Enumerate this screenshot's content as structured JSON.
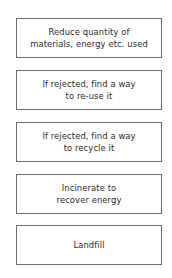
{
  "diagram": {
    "type": "waste-hierarchy",
    "steps": [
      {
        "lines": [
          "Reduce quantity of",
          "materials, energy etc. used"
        ]
      },
      {
        "lines": [
          "If rejected, find a way",
          "to re-use it"
        ]
      },
      {
        "lines": [
          "If rejected, find a way",
          "to recycle it"
        ]
      },
      {
        "lines": [
          "Incinerate to",
          "recover energy"
        ]
      },
      {
        "lines": [
          "Landfill"
        ]
      }
    ],
    "colors": {
      "border": "#6b6b6b",
      "text": "#2a2a2a",
      "background": "#ffffff"
    }
  }
}
